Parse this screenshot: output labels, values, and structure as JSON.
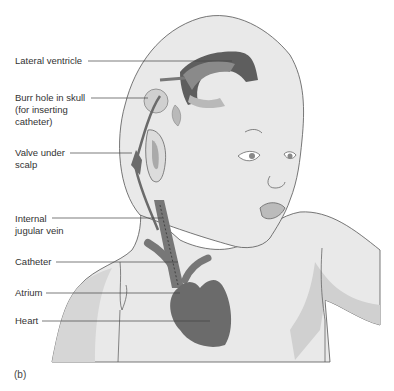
{
  "figure": {
    "panel_label": "(b)",
    "caption_fragment": "Δ... (a) Ill... ...rs ...ation of the hydroceph... ...ld ...ab... ...s..."
  },
  "labels": [
    {
      "id": "lateral-ventricle",
      "text": "Lateral ventricle"
    },
    {
      "id": "burr-hole",
      "text": "Burr hole in skull\n(for inserting\ncatheter)"
    },
    {
      "id": "valve",
      "text": "Valve under\nscalp"
    },
    {
      "id": "jugular",
      "text": "Internal\njugular vein"
    },
    {
      "id": "catheter",
      "text": "Catheter"
    },
    {
      "id": "atrium",
      "text": "Atrium"
    },
    {
      "id": "heart",
      "text": "Heart"
    }
  ],
  "colors": {
    "skin": "#e9e9e9",
    "skin_shadow": "#d6d6d6",
    "ventricle_dark": "#5e5e5e",
    "ventricle_mid": "#8a8a8a",
    "ventricle_light": "#b9b9b9",
    "heart": "#6b6b6b",
    "outline": "#555555",
    "leader": "#444444"
  }
}
